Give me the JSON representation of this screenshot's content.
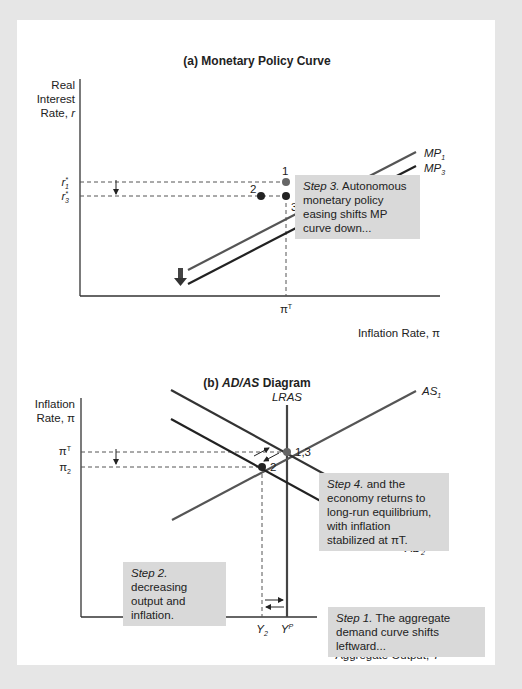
{
  "panel_a": {
    "title": "(a) Monetary Policy Curve",
    "y_axis_label_1": "Real",
    "y_axis_label_2": "Interest",
    "y_axis_label_3": "Rate, r",
    "x_axis_label": "Inflation Rate, π",
    "tick_r1": "r*1",
    "tick_r3": "r*3",
    "tick_piT": "πT",
    "curve_mp1": "MP1",
    "curve_mp3": "MP3",
    "point_1": "1",
    "point_2": "2",
    "point_3": "3",
    "step3_label": "Step 3.",
    "step3_text": "Autonomous monetary policy easing shifts MP curve down..."
  },
  "panel_b": {
    "title": "(b) AD/AS Diagram",
    "y_axis_label_1": "Inflation",
    "y_axis_label_2": "Rate, π",
    "x_axis_label": "Aggregate Output, Y",
    "tick_piT": "πT",
    "tick_pi2": "π2",
    "tick_y2": "Y2",
    "tick_yp": "YP",
    "curve_lras": "LRAS",
    "curve_as1": "AS1",
    "curve_ad1": "AD1",
    "curve_ad2": "AD2",
    "point_13": "1,3",
    "point_2": "2",
    "step1_label": "Step 1.",
    "step1_text": "The aggregate demand curve shifts leftward...",
    "step2_label": "Step 2.",
    "step2_text": "decreasing output and inflation.",
    "step4_label": "Step 4.",
    "step4_text": "and the economy returns to long-run equilibrium, with inflation stabilized at πT."
  },
  "colors": {
    "background": "#e6e6e6",
    "panel": "#ffffff",
    "callout": "#d9d9d9",
    "curve_light": "#555555",
    "curve_dark": "#222222"
  }
}
